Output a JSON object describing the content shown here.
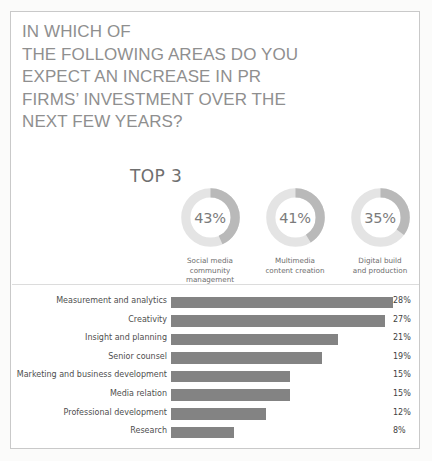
{
  "title": {
    "lines": [
      "IN WHICH OF",
      "THE FOLLOWING AREAS DO YOU",
      "EXPECT AN INCREASE IN PR",
      "FIRMS’ INVESTMENT OVER THE",
      "NEXT FEW YEARS?"
    ]
  },
  "top3": {
    "label": "TOP 3",
    "items": [
      {
        "value_label": "43%",
        "value": 43,
        "caption_line1": "Social media",
        "caption_line2": "community management"
      },
      {
        "value_label": "41%",
        "value": 41,
        "caption_line1": "Multimedia",
        "caption_line2": "content creation"
      },
      {
        "value_label": "35%",
        "value": 35,
        "caption_line1": "Digital build",
        "caption_line2": "and production"
      }
    ]
  },
  "colors": {
    "frame_border": "#c9c9c9",
    "title_text": "#8f8f8f",
    "donut_arc": "#b9b9b9",
    "donut_track": "#e4e4e4",
    "donut_value_text": "#7b7b7b",
    "bar_fill": "#838383",
    "bar_label_text": "#4e4e4e",
    "bar_value_text": "#3f3f3f",
    "divider": "#dcdcdc",
    "card_background": "#ffffff",
    "page_background": "#fbfbfa"
  },
  "chart_data": [
    {
      "type": "pie",
      "title": "TOP 3",
      "subtitle": "",
      "xlabel": "",
      "ylabel": "",
      "grid": false,
      "legend_position": "below-each",
      "note": "three separate donut gauges, each value out of 100 percent, arcs start at 12 o'clock and sweep clockwise",
      "categories": [
        "Social media community management",
        "Multimedia content creation",
        "Digital build and production"
      ],
      "values": [
        43,
        41,
        35
      ],
      "value_labels": [
        "43%",
        "41%",
        "35%"
      ],
      "unit": "%",
      "max": 100
    },
    {
      "type": "bar",
      "orientation": "horizontal",
      "title": "",
      "subtitle": "",
      "xlabel": "",
      "ylabel": "",
      "grid": false,
      "legend_position": "none",
      "unit": "%",
      "xlim": [
        0,
        28
      ],
      "categories": [
        "Measurement and analytics",
        "Creativity",
        "Insight and planning",
        "Senior counsel",
        "Marketing and business development",
        "Media relation",
        "Professional development",
        "Research"
      ],
      "values": [
        28,
        27,
        21,
        19,
        15,
        15,
        12,
        8
      ],
      "value_labels": [
        "28%",
        "27%",
        "21%",
        "19%",
        "15%",
        "15%",
        "12%",
        "8%"
      ]
    }
  ]
}
